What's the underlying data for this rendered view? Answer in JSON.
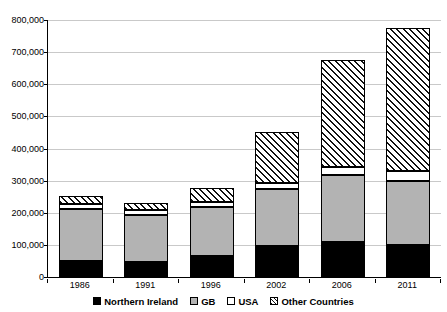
{
  "chart_data": {
    "type": "bar",
    "stacked": true,
    "title": "",
    "xlabel": "",
    "ylabel": "",
    "categories": [
      "1986",
      "1991",
      "1996",
      "2002",
      "2006",
      "2011"
    ],
    "ylim": [
      0,
      800000
    ],
    "ytick_values": [
      0,
      100000,
      200000,
      300000,
      400000,
      500000,
      600000,
      700000,
      800000
    ],
    "ytick_labels": [
      "0",
      "100,000",
      "200,000",
      "300,000",
      "400,000",
      "500,000",
      "600,000",
      "700,000",
      "800,000"
    ],
    "grid": true,
    "legend_position": "bottom",
    "series": [
      {
        "name": "Northern Ireland",
        "color": "#000000",
        "pattern": "solid-black",
        "values": [
          50000,
          47000,
          65000,
          96000,
          109000,
          100000
        ]
      },
      {
        "name": "GB",
        "color": "#b3b3b3",
        "pattern": "solid-gray",
        "values": [
          162000,
          147000,
          152000,
          178000,
          209000,
          200000
        ]
      },
      {
        "name": "USA",
        "color": "#ffffff",
        "pattern": "dotted",
        "values": [
          16000,
          16000,
          16000,
          19000,
          25000,
          31000
        ]
      },
      {
        "name": "Other Countries",
        "color": "#ffffff",
        "pattern": "diagonal-hatch",
        "values": [
          24000,
          21000,
          45000,
          157000,
          334000,
          444000
        ]
      }
    ],
    "totals": [
      252000,
      231000,
      278000,
      450000,
      677000,
      775000
    ]
  },
  "legend": {
    "items": [
      {
        "label": "Northern Ireland",
        "swatch": "solid-black"
      },
      {
        "label": "GB",
        "swatch": "solid-gray"
      },
      {
        "label": "USA",
        "swatch": "white"
      },
      {
        "label": "Other Countries",
        "swatch": "diagonal-hatch"
      }
    ]
  }
}
